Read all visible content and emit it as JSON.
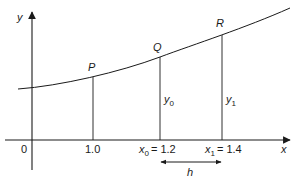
{
  "diagram": {
    "axes": {
      "x_label": "x",
      "y_label": "y",
      "origin_label": "0"
    },
    "points": [
      {
        "name": "P",
        "x": 1.0
      },
      {
        "name": "Q",
        "x": 1.2
      },
      {
        "name": "R",
        "x": 1.4
      }
    ],
    "tick_labels": {
      "t1": "1.0",
      "x0_var": "x",
      "x0_sub": "0",
      "x0_value": "= 1.2",
      "x1_var": "x",
      "x1_sub": "1",
      "x1_value": "= 1.4"
    },
    "ordinates": {
      "y0_var": "y",
      "y0_sub": "0",
      "y1_var": "y",
      "y1_sub": "1"
    },
    "step_label": "h",
    "colors": {
      "line": "#1a1a1a",
      "background": "#ffffff"
    }
  }
}
